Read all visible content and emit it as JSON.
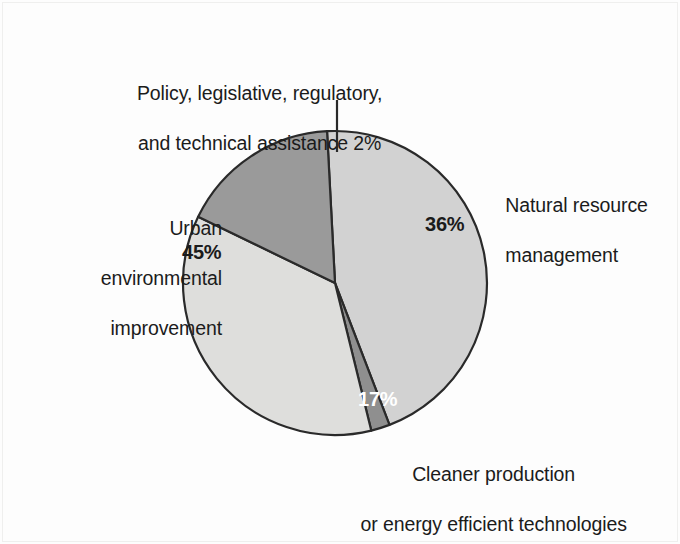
{
  "chart_data": {
    "type": "pie",
    "title": "",
    "subtitle": "",
    "xlabel": "",
    "ylabel": "",
    "legend_position": "none",
    "grid": false,
    "units": "percent",
    "total": 100,
    "start_angle_deg": 357,
    "direction": "clockwise",
    "categories": [
      "Policy, legislative, regulatory, and technical assistance",
      "Natural resource management",
      "Cleaner production or energy efficient technologies",
      "Urban environmental improvement"
    ],
    "values": [
      2,
      36,
      17,
      45
    ],
    "slices": [
      {
        "id": "policy",
        "label_line1": "Policy, legislative, regulatory,",
        "label_line2": "and technical assistance 2%",
        "value": 2,
        "value_label": "2%",
        "color": "#8f8f8f",
        "label_placement": "outside-top",
        "label_color": "#1b1b1b",
        "has_leader_line": true
      },
      {
        "id": "natural",
        "label_line1": "Natural resource",
        "label_line2": "management",
        "value": 36,
        "value_label": "36%",
        "color": "#dededc",
        "label_placement": "outside-right",
        "label_color": "#1b1b1b"
      },
      {
        "id": "cleaner",
        "label_line1": "Cleaner production",
        "label_line2": "or energy efficient technologies",
        "value": 17,
        "value_label": "17%",
        "color": "#9a9a9a",
        "label_placement": "outside-bottom",
        "label_color": "#ffffff"
      },
      {
        "id": "urban",
        "label_line1": "Urban",
        "label_line2": "environmental",
        "label_line3": "improvement",
        "value": 45,
        "value_label": "45%",
        "color": "#d2d2d2",
        "label_placement": "outside-left",
        "label_color": "#1b1b1b"
      }
    ]
  },
  "labels": {
    "policy_line1": "Policy, legislative, regulatory,",
    "policy_line2": "and technical assistance 2%",
    "urban_line1": "Urban",
    "urban_line2": "environmental",
    "urban_line3": "improvement",
    "natural_line1": "Natural resource",
    "natural_line2": "management",
    "cleaner_line1": "Cleaner production",
    "cleaner_line2": "or energy efficient technologies"
  },
  "percent_labels": {
    "urban": "45%",
    "natural": "36%",
    "cleaner": "17%",
    "policy": "2%"
  },
  "colors": {
    "slice_policy": "#8f8f8f",
    "slice_natural": "#dededc",
    "slice_cleaner": "#9a9a9a",
    "slice_urban": "#d2d2d2",
    "outline": "#2a2a2a",
    "text": "#1b1b1b",
    "text_on_dark": "#ffffff",
    "background": "#fdfdfd"
  }
}
